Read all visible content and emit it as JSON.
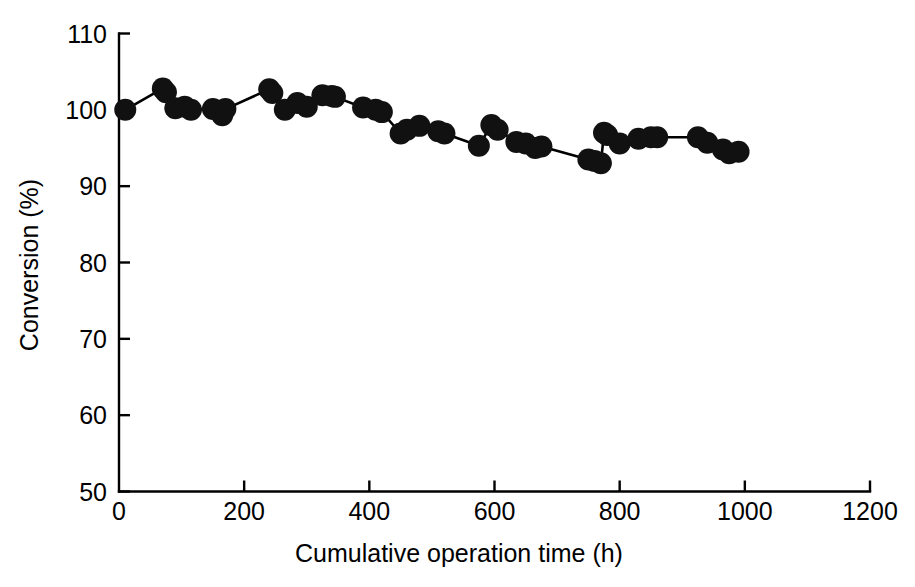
{
  "chart_data": {
    "type": "line",
    "title": "",
    "xlabel": "Cumulative operation time (h)",
    "ylabel": "Conversion (%)",
    "xlim": [
      0,
      1200
    ],
    "ylim": [
      50,
      110
    ],
    "xticks": [
      0,
      200,
      400,
      600,
      800,
      1000,
      1200
    ],
    "yticks": [
      50,
      60,
      70,
      80,
      90,
      100,
      110
    ],
    "xtick_labels": [
      "0",
      "200",
      "400",
      "600",
      "800",
      "1000",
      "1200"
    ],
    "ytick_labels": [
      "50",
      "60",
      "70",
      "80",
      "90",
      "100",
      "110"
    ],
    "grid": false,
    "legend": null,
    "marker": "filled-circle",
    "marker_color": "#111111",
    "line_color": "#000000",
    "series": [
      {
        "name": "Conversion",
        "x": [
          10,
          70,
          75,
          90,
          105,
          115,
          150,
          165,
          170,
          240,
          245,
          265,
          285,
          300,
          325,
          340,
          345,
          390,
          410,
          420,
          450,
          460,
          480,
          510,
          520,
          575,
          595,
          605,
          635,
          650,
          665,
          675,
          750,
          760,
          770,
          775,
          780,
          800,
          830,
          850,
          860,
          925,
          940,
          965,
          975,
          990
        ],
        "y": [
          100.0,
          102.8,
          102.3,
          100.2,
          100.4,
          100.0,
          100.1,
          99.3,
          100.1,
          102.7,
          102.2,
          100.0,
          100.9,
          100.4,
          101.9,
          101.8,
          101.7,
          100.3,
          100.0,
          99.7,
          96.9,
          97.4,
          97.9,
          97.2,
          96.9,
          95.3,
          98.0,
          97.4,
          95.8,
          95.6,
          95.0,
          95.2,
          93.5,
          93.3,
          93.0,
          97.0,
          96.7,
          95.6,
          96.2,
          96.4,
          96.4,
          96.4,
          95.7,
          94.8,
          94.3,
          94.5
        ]
      }
    ]
  },
  "axis": {
    "x_title": "Cumulative operation time (h)",
    "y_title": "Conversion (%)"
  }
}
